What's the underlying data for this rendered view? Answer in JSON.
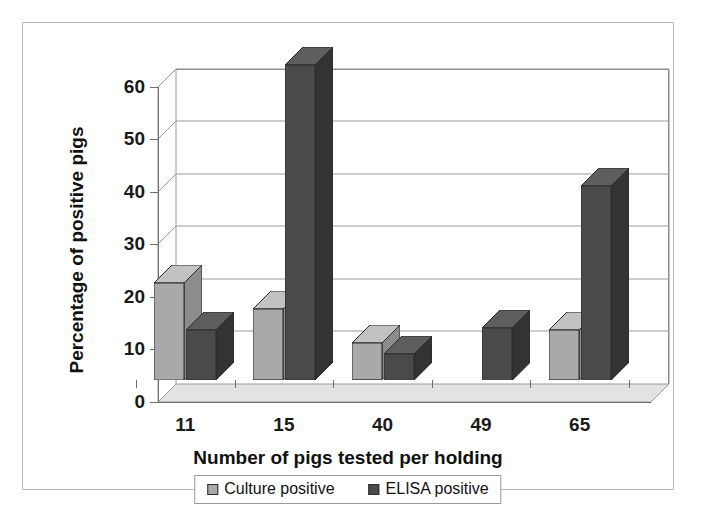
{
  "figure": {
    "background": "#ffffff",
    "border_color": "#b9b9b9"
  },
  "chart_data": {
    "type": "bar",
    "title": "",
    "subtitle": "",
    "xlabel": "Number of pigs tested per holding",
    "ylabel": "Percentage of positive pigs",
    "categories": [
      "11",
      "15",
      "40",
      "49",
      "65"
    ],
    "series": [
      {
        "name": "Culture positive",
        "color": "#a9a9a9",
        "side_color": "#8c8c8c",
        "top_color": "#c2c2c2",
        "values": [
          18.5,
          13.5,
          7,
          0,
          9.5
        ]
      },
      {
        "name": "ELISA positive",
        "color": "#4a4a4a",
        "side_color": "#333333",
        "top_color": "#5e5e5e",
        "values": [
          9.5,
          60,
          5,
          10,
          37
        ]
      }
    ],
    "ylim": [
      0,
      60
    ],
    "yticks": [
      0,
      10,
      20,
      30,
      40,
      50,
      60
    ],
    "ytick_labels": [
      "0",
      "10",
      "20",
      "30",
      "40",
      "50",
      "60"
    ],
    "grid": true,
    "grid_axis": "y",
    "legend_position": "bottom",
    "three_d": true
  },
  "legend": {
    "items": [
      {
        "label": "Culture positive",
        "color": "#a9a9a9"
      },
      {
        "label": "ELISA positive",
        "color": "#4a4a4a"
      }
    ]
  }
}
